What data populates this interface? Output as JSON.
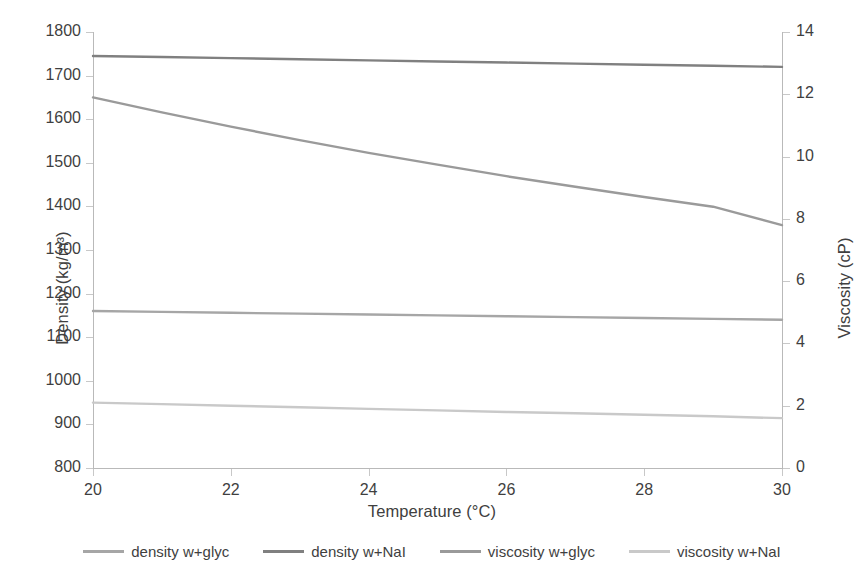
{
  "chart_data": {
    "type": "line",
    "title": "",
    "xlabel": "Temperature (°C)",
    "ylabel": "Density (kg/m³)",
    "y2label": "Viscosity (cP)",
    "xlim": [
      20,
      30
    ],
    "ylim": [
      800,
      1800
    ],
    "y2lim": [
      0,
      14
    ],
    "xticks": [
      20,
      22,
      24,
      26,
      28,
      30
    ],
    "yticks": [
      800,
      900,
      1000,
      1100,
      1200,
      1300,
      1400,
      1500,
      1600,
      1700,
      1800
    ],
    "y2ticks": [
      0,
      2,
      4,
      6,
      8,
      10,
      12,
      14
    ],
    "grid": false,
    "legend_position": "bottom",
    "x": [
      20,
      21,
      22,
      23,
      24,
      25,
      26,
      27,
      28,
      29,
      30
    ],
    "series": [
      {
        "name": "density w+glyc",
        "axis": "left",
        "color": "#a6a6a6",
        "values": [
          1160,
          1158,
          1156,
          1154,
          1152,
          1150,
          1148,
          1146,
          1144,
          1142,
          1140
        ]
      },
      {
        "name": "density w+NaI",
        "axis": "left",
        "color": "#808080",
        "values": [
          1745,
          1742.5,
          1740,
          1737.5,
          1735,
          1732.5,
          1730,
          1727.5,
          1725,
          1722.5,
          1720
        ]
      },
      {
        "name": "viscosity w+glyc",
        "axis": "right",
        "color": "#9a9a9a",
        "values": [
          11.9,
          11.42,
          10.96,
          10.53,
          10.12,
          9.74,
          9.37,
          9.03,
          8.7,
          8.39,
          7.8
        ]
      },
      {
        "name": "viscosity w+NaI",
        "axis": "right",
        "color": "#c9c9c9",
        "values": [
          2.1,
          2.05,
          2.0,
          1.95,
          1.9,
          1.85,
          1.8,
          1.76,
          1.71,
          1.66,
          1.6
        ]
      }
    ]
  },
  "legend": {
    "items": [
      {
        "label": "density w+glyc",
        "color": "#a6a6a6"
      },
      {
        "label": "density w+NaI",
        "color": "#808080"
      },
      {
        "label": "viscosity w+glyc",
        "color": "#9a9a9a"
      },
      {
        "label": "viscosity w+NaI",
        "color": "#c9c9c9"
      }
    ]
  }
}
